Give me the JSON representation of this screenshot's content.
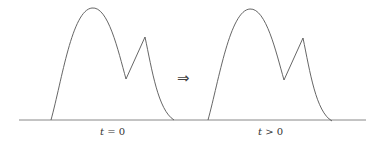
{
  "diagram": {
    "arrow_symbol": "⇒",
    "panels": [
      {
        "id": "initial",
        "label_var": "t",
        "label_rel": " = 0",
        "label": "t = 0"
      },
      {
        "id": "evolved",
        "label_var": "t",
        "label_rel": " > 0",
        "label": "t > 0"
      }
    ],
    "colors": {
      "curve": "#555555",
      "axis": "#777777",
      "background": "#ffffff"
    }
  }
}
